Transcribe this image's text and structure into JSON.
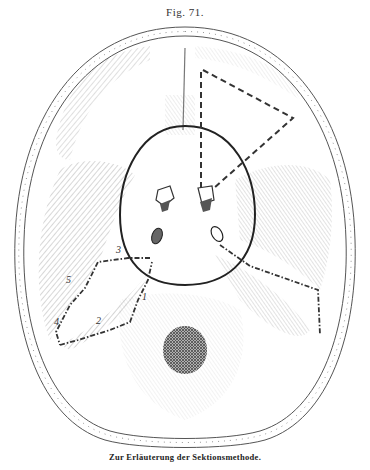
{
  "figure": {
    "title": "Fig. 71.",
    "caption": "Zur Erläuterung der Sektionsmethode.",
    "labels": [
      {
        "id": "1",
        "text": "1"
      },
      {
        "id": "2",
        "text": "2"
      },
      {
        "id": "3",
        "text": "3"
      },
      {
        "id": "4",
        "text": "4"
      },
      {
        "id": "5",
        "text": "5"
      }
    ],
    "colors": {
      "ink": "#333333",
      "paper": "#ffffff",
      "shading": "#8a8a8a",
      "foramen": "#5a5a5a"
    }
  }
}
